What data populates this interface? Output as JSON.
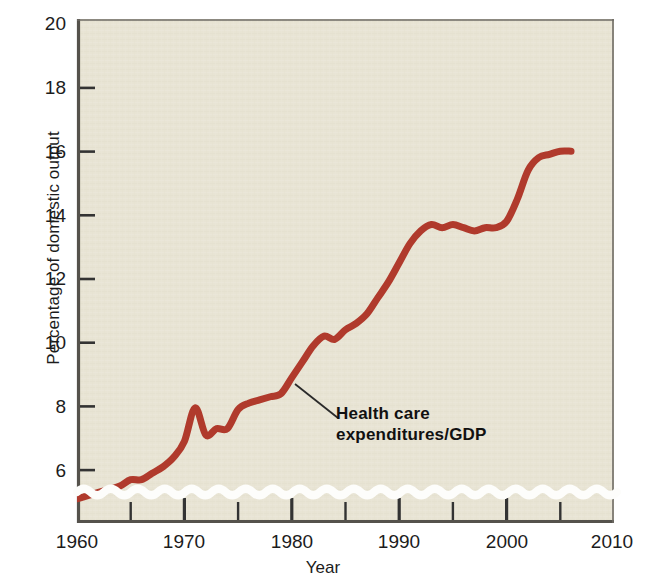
{
  "chart_data": {
    "type": "line",
    "title": "",
    "xlabel": "Year",
    "ylabel": "Percentage of domestic output",
    "xlim": [
      1960,
      2010
    ],
    "ylim": [
      5,
      20
    ],
    "y_axis_break": true,
    "grid": false,
    "legend_position": "none",
    "line_color": "#b03a2c",
    "plot_background": "#e7e3d3",
    "page_background": "#ffffff",
    "axis_color": "#4d4d4d",
    "x_ticks_major": [
      1960,
      1970,
      1980,
      1990,
      2000,
      2010
    ],
    "x_ticks_major_labels": [
      "1960",
      "1970",
      "1980",
      "1990",
      "2000",
      "2010"
    ],
    "x_ticks_minor": [
      1965,
      1975,
      1985,
      1995,
      2005
    ],
    "y_ticks": [
      6,
      8,
      10,
      12,
      14,
      16,
      18,
      20
    ],
    "y_ticks_labels": [
      "6",
      "8",
      "10",
      "12",
      "14",
      "16",
      "18",
      "20"
    ],
    "series": [
      {
        "name": "Health care expenditures/GDP",
        "x": [
          1960,
          1961,
          1962,
          1963,
          1964,
          1965,
          1966,
          1967,
          1968,
          1969,
          1970,
          1971,
          1972,
          1973,
          1974,
          1975,
          1976,
          1977,
          1978,
          1979,
          1980,
          1981,
          1982,
          1983,
          1984,
          1985,
          1986,
          1987,
          1988,
          1989,
          1990,
          1991,
          1992,
          1993,
          1994,
          1995,
          1996,
          1997,
          1998,
          1999,
          2000,
          2001,
          2002,
          2003,
          2004,
          2005,
          2006
        ],
        "values": [
          5.1,
          5.2,
          5.3,
          5.4,
          5.5,
          5.7,
          5.7,
          5.9,
          6.1,
          6.4,
          6.9,
          7.954,
          7.1,
          7.3,
          7.3,
          7.9,
          8.1,
          8.2,
          8.3,
          8.4,
          8.9,
          9.4,
          9.9,
          10.2,
          10.1,
          10.4,
          10.6,
          10.9,
          11.4,
          11.9,
          12.5,
          13.1,
          13.5,
          13.7,
          13.6,
          13.7,
          13.6,
          13.5,
          13.6,
          13.6,
          13.8,
          14.5,
          15.4,
          15.8,
          15.9,
          16.0,
          16.0
        ]
      }
    ],
    "annotations": [
      {
        "text_line1": "Health care",
        "text_line2": "expenditures/GDP",
        "points_to_year": 1981,
        "points_to_value": 9.6
      }
    ]
  }
}
